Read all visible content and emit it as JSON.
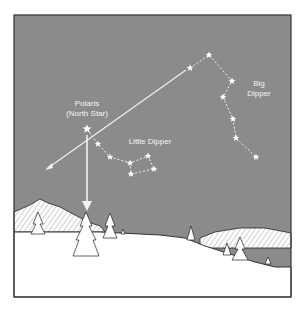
{
  "diagram": {
    "colors": {
      "sky": "#8b8b8b",
      "star": "#ffffff",
      "line": "#f2f2f2",
      "snow": "#ffffff",
      "frame": "#333333",
      "text": "#f4f4f4"
    },
    "labels": {
      "polaris": "Polaris",
      "polaris_sub": "(North Star)",
      "little_dipper": "Little Dipper",
      "big_dipper_1": "Big",
      "big_dipper_2": "Dipper"
    },
    "big_dipper_stars": [
      [
        190,
        68
      ],
      [
        209,
        55
      ],
      [
        232,
        81
      ],
      [
        223,
        97
      ],
      [
        233,
        119
      ],
      [
        236,
        138
      ],
      [
        256,
        157
      ]
    ],
    "little_dipper_stars": [
      [
        98,
        144
      ],
      [
        110,
        157
      ],
      [
        130,
        163
      ],
      [
        148,
        156
      ],
      [
        154,
        169
      ],
      [
        131,
        174
      ]
    ],
    "polaris": [
      87,
      129
    ]
  }
}
